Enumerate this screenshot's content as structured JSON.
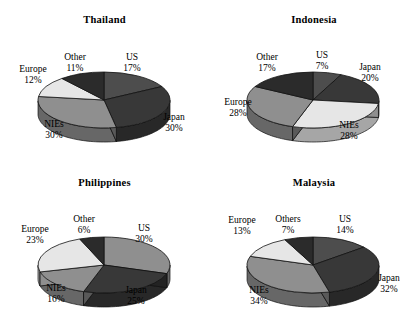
{
  "figure": {
    "panel_count": 4,
    "style": "3d-pie"
  },
  "palette": {
    "us": "#4d4d4d",
    "japan": "#383838",
    "nies": "#8f8f8f",
    "europe": "#e6e6e6",
    "other": "#2b2b2b",
    "outline": "#111111",
    "background": "#ffffff"
  },
  "chart_data": [
    {
      "type": "pie",
      "title": "Thailand",
      "categories": [
        "US",
        "Japan",
        "NIEs",
        "Europe",
        "Other"
      ],
      "values": [
        17,
        30,
        30,
        12,
        11
      ],
      "labels": [
        "17%",
        "30%",
        "30%",
        "12%",
        "11%"
      ],
      "unit": "%",
      "legend": "none",
      "colors": [
        "#4d4d4d",
        "#383838",
        "#8f8f8f",
        "#e6e6e6",
        "#2b2b2b"
      ]
    },
    {
      "type": "pie",
      "title": "Indonesia",
      "categories": [
        "US",
        "Japan",
        "NIEs",
        "Europe",
        "Other"
      ],
      "values": [
        7,
        20,
        28,
        28,
        17
      ],
      "labels": [
        "7%",
        "20%",
        "28%",
        "28%",
        "17%"
      ],
      "unit": "%",
      "legend": "none",
      "colors": [
        "#4d4d4d",
        "#383838",
        "#e6e6e6",
        "#8f8f8f",
        "#2b2b2b"
      ]
    },
    {
      "type": "pie",
      "title": "Philippines",
      "categories": [
        "US",
        "Japan",
        "NIEs",
        "Europe",
        "Other"
      ],
      "values": [
        30,
        25,
        16,
        23,
        6
      ],
      "labels": [
        "30%",
        "25%",
        "16%",
        "23%",
        "6%"
      ],
      "unit": "%",
      "legend": "none",
      "colors": [
        "#8f8f8f",
        "#383838",
        "#8f8f8f",
        "#e6e6e6",
        "#2b2b2b"
      ]
    },
    {
      "type": "pie",
      "title": "Malaysia",
      "categories": [
        "US",
        "Japan",
        "NIEs",
        "Europe",
        "Others"
      ],
      "values": [
        14,
        32,
        34,
        13,
        7
      ],
      "labels": [
        "14%",
        "32%",
        "34%",
        "13%",
        "7%"
      ],
      "unit": "%",
      "legend": "none",
      "colors": [
        "#4d4d4d",
        "#383838",
        "#8f8f8f",
        "#e6e6e6",
        "#2b2b2b"
      ]
    }
  ],
  "panels": {
    "thailand": {
      "title": "Thailand",
      "slices": {
        "us": {
          "name": "US",
          "pct": "17%"
        },
        "japan": {
          "name": "Japan",
          "pct": "30%"
        },
        "nies": {
          "name": "NIEs",
          "pct": "30%"
        },
        "europe": {
          "name": "Europe",
          "pct": "12%"
        },
        "other": {
          "name": "Other",
          "pct": "11%"
        }
      }
    },
    "indonesia": {
      "title": "Indonesia",
      "slices": {
        "us": {
          "name": "US",
          "pct": "7%"
        },
        "japan": {
          "name": "Japan",
          "pct": "20%"
        },
        "nies": {
          "name": "NIEs",
          "pct": "28%"
        },
        "europe": {
          "name": "Europe",
          "pct": "28%"
        },
        "other": {
          "name": "Other",
          "pct": "17%"
        }
      }
    },
    "philippines": {
      "title": "Philippines",
      "slices": {
        "us": {
          "name": "US",
          "pct": "30%"
        },
        "japan": {
          "name": "Japan",
          "pct": "25%"
        },
        "nies": {
          "name": "NIEs",
          "pct": "16%"
        },
        "europe": {
          "name": "Europe",
          "pct": "23%"
        },
        "other": {
          "name": "Other",
          "pct": "6%"
        }
      }
    },
    "malaysia": {
      "title": "Malaysia",
      "slices": {
        "us": {
          "name": "US",
          "pct": "14%"
        },
        "japan": {
          "name": "Japan",
          "pct": "32%"
        },
        "nies": {
          "name": "NIEs",
          "pct": "34%"
        },
        "europe": {
          "name": "Europe",
          "pct": "13%"
        },
        "other": {
          "name": "Others",
          "pct": "7%"
        }
      }
    }
  }
}
